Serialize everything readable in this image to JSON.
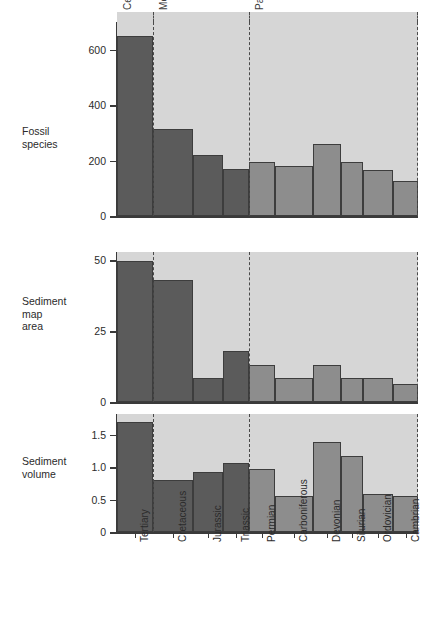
{
  "figure": {
    "title": "",
    "background_color": "#ffffff",
    "plot_background_color": "#d6d6d6",
    "bar_color_dark": "#5b5b5b",
    "bar_color_light": "#8d8d8d",
    "axis_color": "#3a3a3a"
  },
  "eras": [
    {
      "name": "Cenozoic",
      "shade": "dark"
    },
    {
      "name": "Mesozoic",
      "shade": "dark"
    },
    {
      "name": "Paleozoic",
      "shade": "light"
    }
  ],
  "panels": [
    {
      "row_label": "Fossil\nspecies",
      "ticks": [
        "0",
        "200",
        "400",
        "600"
      ]
    },
    {
      "row_label": "Sediment\nmap\narea",
      "ticks": [
        "0",
        "25",
        "50"
      ]
    },
    {
      "row_label": "Sediment\nvolume",
      "ticks": [
        "0",
        "0.5",
        "1.0",
        "1.5"
      ]
    }
  ],
  "chart_data": [
    {
      "type": "bar",
      "title": "Fossil species",
      "xlabel": "",
      "ylabel": "Fossil species",
      "ylim": [
        0,
        700
      ],
      "yticks": [
        0,
        200,
        400,
        600
      ],
      "grid": false,
      "legend": "none",
      "categories": [
        "Tertiary",
        "Cretaceous",
        "Jurassic",
        "Triassic",
        "Permian",
        "Carboniferous",
        "Devonian",
        "Silurian",
        "Ordovician",
        "Cambrian"
      ],
      "era_of_category": [
        "Cenozoic",
        "Mesozoic",
        "Mesozoic",
        "Mesozoic",
        "Paleozoic",
        "Paleozoic",
        "Paleozoic",
        "Paleozoic",
        "Paleozoic",
        "Paleozoic"
      ],
      "values": [
        650,
        315,
        220,
        170,
        195,
        180,
        260,
        195,
        165,
        125
      ]
    },
    {
      "type": "bar",
      "title": "Sediment map area",
      "xlabel": "",
      "ylabel": "Sediment map area",
      "ylim": [
        0,
        53
      ],
      "yticks": [
        0,
        25,
        50
      ],
      "grid": false,
      "legend": "none",
      "categories": [
        "Tertiary",
        "Cretaceous",
        "Jurassic",
        "Triassic",
        "Permian",
        "Carboniferous",
        "Devonian",
        "Silurian",
        "Ordovician",
        "Cambrian"
      ],
      "era_of_category": [
        "Cenozoic",
        "Mesozoic",
        "Mesozoic",
        "Mesozoic",
        "Paleozoic",
        "Paleozoic",
        "Paleozoic",
        "Paleozoic",
        "Paleozoic",
        "Paleozoic"
      ],
      "values": [
        50,
        43,
        8.5,
        18,
        13,
        8.5,
        13,
        8.5,
        8.5,
        6.5
      ]
    },
    {
      "type": "bar",
      "title": "Sediment volume",
      "xlabel": "",
      "ylabel": "Sediment volume",
      "ylim": [
        0,
        1.82
      ],
      "yticks": [
        0,
        0.5,
        1.0,
        1.5
      ],
      "grid": false,
      "legend": "none",
      "categories": [
        "Tertiary",
        "Cretaceous",
        "Jurassic",
        "Triassic",
        "Permian",
        "Carboniferous",
        "Devonian",
        "Silurian",
        "Ordovician",
        "Cambrian"
      ],
      "era_of_category": [
        "Cenozoic",
        "Mesozoic",
        "Mesozoic",
        "Mesozoic",
        "Paleozoic",
        "Paleozoic",
        "Paleozoic",
        "Paleozoic",
        "Paleozoic",
        "Paleozoic"
      ],
      "values": [
        1.7,
        0.8,
        0.92,
        1.07,
        0.97,
        0.56,
        1.39,
        1.17,
        0.59,
        0.56
      ]
    }
  ],
  "x_axis": {
    "categories": [
      "Tertiary",
      "Cretaceous",
      "Jurassic",
      "Triassic",
      "Permian",
      "Carboniferous",
      "Devonian",
      "Silurian",
      "Ordovician",
      "Cambrian"
    ]
  }
}
